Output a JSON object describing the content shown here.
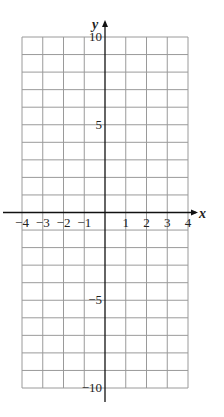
{
  "chart_data": {
    "type": "scatter",
    "title": "",
    "xlabel": "x",
    "ylabel": "y",
    "xlim": [
      -4,
      4
    ],
    "ylim": [
      -10,
      10
    ],
    "grid": true,
    "x_ticks": [
      -4,
      -3,
      -2,
      -1,
      1,
      2,
      3,
      4
    ],
    "x_tick_labels": [
      "−4",
      "−3",
      "−2",
      "−1",
      "1",
      "2",
      "3",
      "4"
    ],
    "y_ticks": [
      10,
      5,
      -5,
      -10
    ],
    "y_tick_labels": [
      "10",
      "5",
      "−5",
      "−10"
    ],
    "grid_x_step": 1,
    "grid_y_step": 1,
    "series": [],
    "colors": {
      "grid": "#9a9a9a",
      "axis": "#111111",
      "text": "#222222"
    }
  }
}
